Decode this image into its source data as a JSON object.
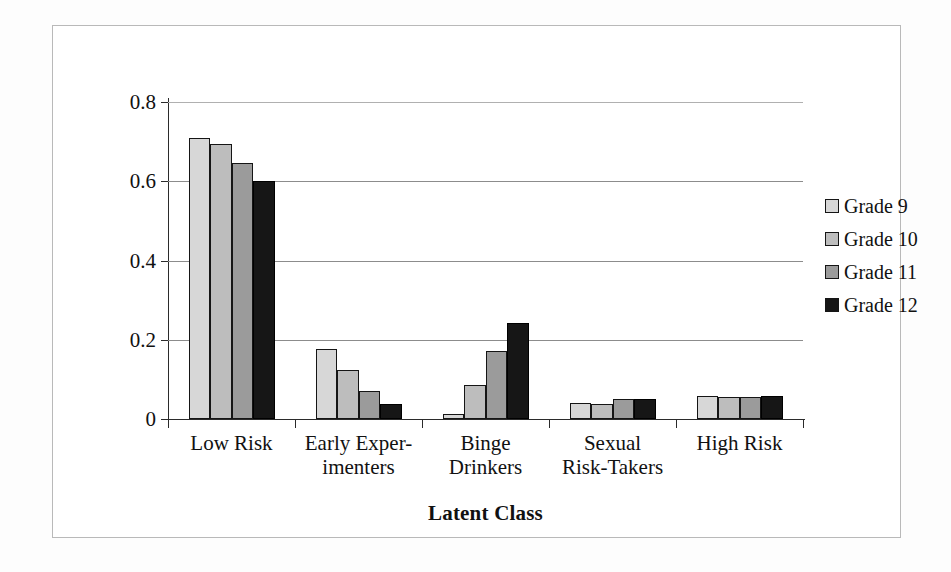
{
  "chart_data": {
    "type": "bar",
    "title": "",
    "xlabel": "Latent Class",
    "ylabel": "",
    "ylim": [
      0,
      0.8
    ],
    "yticks": [
      0,
      0.2,
      0.4,
      0.6,
      0.8
    ],
    "ytick_labels": [
      "0",
      "0.2",
      "0.4",
      "0.6",
      "0.8"
    ],
    "grid": true,
    "legend_position": "right",
    "categories": [
      {
        "line1": "Low Risk",
        "line2": ""
      },
      {
        "line1": "Early Exper-",
        "line2": "imenters"
      },
      {
        "line1": "Binge",
        "line2": "Drinkers"
      },
      {
        "line1": "Sexual",
        "line2": "Risk-Takers"
      },
      {
        "line1": "High Risk",
        "line2": ""
      }
    ],
    "category_labels": [
      "Low Risk",
      "Early Experimenters",
      "Binge Drinkers",
      "Sexual Risk-Takers",
      "High Risk"
    ],
    "series": [
      {
        "name": "Grade 9",
        "color": "#d7d7d7",
        "values": [
          0.71,
          0.176,
          0.013,
          0.041,
          0.057
        ]
      },
      {
        "name": "Grade 10",
        "color": "#bdbdbd",
        "values": [
          0.694,
          0.124,
          0.085,
          0.038,
          0.056
        ]
      },
      {
        "name": "Grade 11",
        "color": "#9b9b9b",
        "values": [
          0.645,
          0.071,
          0.172,
          0.05,
          0.056
        ]
      },
      {
        "name": "Grade 12",
        "color": "#161616",
        "values": [
          0.6,
          0.038,
          0.242,
          0.051,
          0.058
        ]
      }
    ]
  },
  "legend": {
    "items": [
      {
        "label": "Grade 9"
      },
      {
        "label": "Grade 10"
      },
      {
        "label": "Grade 11"
      },
      {
        "label": "Grade 12"
      }
    ]
  }
}
